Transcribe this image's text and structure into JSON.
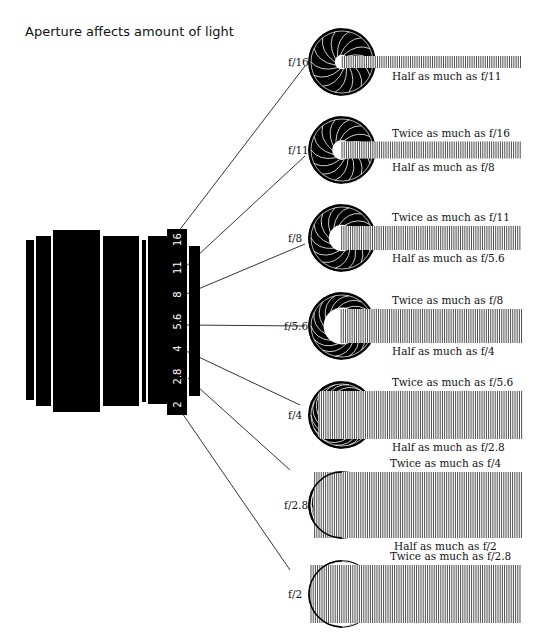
{
  "title": "Aperture affects amount of light",
  "lens_scale": [
    "16",
    "11",
    "8",
    "5.6",
    "4",
    "2.8",
    "2"
  ],
  "stops": [
    {
      "label": "f/16",
      "above": "",
      "below": "Half as much as f/11",
      "cy": 62,
      "open": 0.22,
      "beam_h": 12
    },
    {
      "label": "f/11",
      "above": "Twice as much as f/16",
      "below": "Half as much as f/8",
      "cy": 150,
      "open": 0.3,
      "beam_h": 17
    },
    {
      "label": "f/8",
      "above": "Twice as much as f/11",
      "below": "Half as much as f/5.6",
      "cy": 238,
      "open": 0.4,
      "beam_h": 24
    },
    {
      "label": "f/5.6",
      "above": "Twice as much as f/8",
      "below": "Half as much as f/4",
      "cy": 326,
      "open": 0.56,
      "beam_h": 34
    },
    {
      "label": "f/4",
      "above": "Twice as much as f/5.6",
      "below": "Half as much as f/2.8",
      "cy": 415,
      "open": 0.72,
      "beam_h": 48
    },
    {
      "label": "f/2.8",
      "above": "Twice as much as f/4",
      "below": "Half as much as f/2",
      "cy": 505,
      "open": 0.86,
      "beam_h": 66
    },
    {
      "label": "f/2",
      "above": "Twice as much as f/2.8",
      "below": "",
      "cy": 594,
      "open": 0.97,
      "beam_h": 58
    }
  ],
  "colors": {
    "ink": "#000000",
    "paper": "#ffffff"
  }
}
